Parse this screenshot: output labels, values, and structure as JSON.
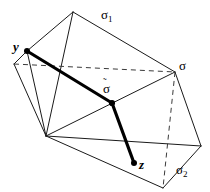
{
  "figure": {
    "type": "geometric-diagram",
    "background_color": "#ffffff",
    "line_color": "#1a1a1a",
    "thick_line_color": "#000000",
    "labels": {
      "sigma1": "σ",
      "sigma1_sub": "1",
      "sigma": "σ",
      "sigma2": "σ",
      "sigma2_sub": "2",
      "sigma_tilde": "σ",
      "sigma_tilde_mark": "˜",
      "y": "y",
      "z": "z"
    },
    "vertices": {
      "apex": [
        73,
        12
      ],
      "y_point": [
        27,
        51
      ],
      "left": [
        14,
        64
      ],
      "bottom_left": [
        46,
        136
      ],
      "sigma_point": [
        175,
        72
      ],
      "right": [
        201,
        146
      ],
      "bottom": [
        163,
        188
      ],
      "sigma_tilde_point": [
        112,
        103
      ],
      "z_point": [
        134,
        163
      ]
    },
    "marked_points": [
      "y_point",
      "sigma_tilde_point",
      "z_point"
    ],
    "thick_path": "y → σ̃ → z",
    "dashed_edges": [
      "left → sigma_point",
      "sigma_point → bottom"
    ]
  }
}
